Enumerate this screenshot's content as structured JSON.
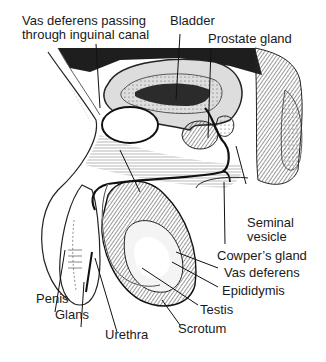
{
  "diagram": {
    "labels": {
      "vas_inguinal_line1": "Vas deferens passing",
      "vas_inguinal_line2": "through inguinal canal",
      "bladder": "Bladder",
      "prostate": "Prostate gland",
      "seminal_line1": "Seminal",
      "seminal_line2": "vesicle",
      "cowpers": "Cowper’s gland",
      "vas_deferens": "Vas deferens",
      "epididymis": "Epididymis",
      "testis": "Testis",
      "scrotum": "Scrotum",
      "penis": "Penis",
      "glans": "Glans",
      "urethra": "Urethra"
    },
    "colors": {
      "ink": "#1a1a1a",
      "background": "#ffffff",
      "shade": "#3a3a3a"
    }
  }
}
